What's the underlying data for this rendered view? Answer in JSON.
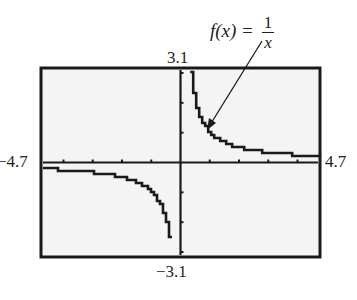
{
  "chart_data": {
    "type": "line",
    "title": "",
    "function_label": "f(x) = 1/x",
    "xlim": [
      -4.7,
      4.7
    ],
    "ylim": [
      -3.1,
      3.1
    ],
    "xlabel": "",
    "ylabel": "",
    "x_tick_step": 1,
    "y_tick_step": 1,
    "grid": false,
    "style": "graphing-calculator pixel plot",
    "series": [
      {
        "name": "f(x) = 1/x",
        "x": [
          -4.7,
          -4,
          -3,
          -2,
          -1.5,
          -1,
          -0.7,
          -0.5,
          -0.4,
          -0.35,
          0.35,
          0.4,
          0.5,
          0.7,
          1,
          1.5,
          2,
          3,
          4,
          4.7
        ],
        "y": [
          -0.213,
          -0.25,
          -0.333,
          -0.5,
          -0.667,
          -1,
          -1.429,
          -2,
          -2.5,
          -2.857,
          2.857,
          2.5,
          2,
          1.429,
          1,
          0.667,
          0.5,
          0.333,
          0.25,
          0.213
        ]
      }
    ]
  },
  "labels": {
    "ymax": "3.1",
    "ymin": "−3.1",
    "xmin": "−4.7",
    "xmax": "4.7",
    "formula_lhs": "f(x) =",
    "formula_num": "1",
    "formula_den": "x"
  }
}
